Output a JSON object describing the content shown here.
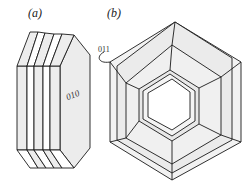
{
  "figure": {
    "panel_a": {
      "label": "(a)",
      "face_label": "010",
      "description": "Stack of thin hexagonal plates viewed obliquely"
    },
    "panel_b": {
      "label": "(b)",
      "face_label": "011",
      "description": "Hexagonal frame/tube with stepped inner and outer rims"
    }
  },
  "colors": {
    "line": "#1a1a1a",
    "face_light": "#f2f2f2",
    "face_mid": "#e6e6e6",
    "face_white": "#ffffff"
  }
}
